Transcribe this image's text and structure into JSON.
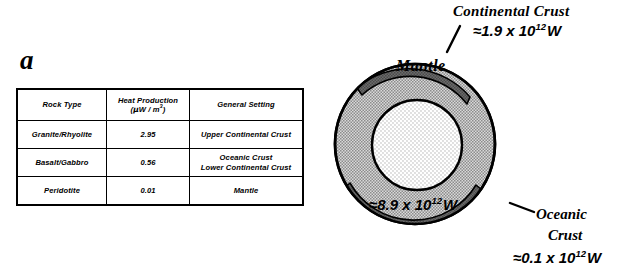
{
  "figure": {
    "panel_a_letter": "a",
    "panel_b_letter": "b"
  },
  "table": {
    "headers": [
      {
        "line1": "Rock Type",
        "line2": ""
      },
      {
        "line1": "Heat Production",
        "line2_prefix": "(",
        "line2_mu": "μ",
        "line2_mid": "W / m",
        "line2_sup": "3",
        "line2_suffix": ")"
      },
      {
        "line1": "General Setting",
        "line2": ""
      }
    ],
    "rows": [
      {
        "rock_type": "Granite/Rhyolite",
        "heat_production": "2.95",
        "general_setting_line1": "Upper Continental Crust",
        "general_setting_line2": ""
      },
      {
        "rock_type": "Basalt/Gabbro",
        "heat_production": "0.56",
        "general_setting_line1": "Oceanic Crust",
        "general_setting_line2": "Lower Continental Crust"
      },
      {
        "rock_type": "Peridotite",
        "heat_production": "0.01",
        "general_setting_line1": "Mantle",
        "general_setting_line2": ""
      }
    ]
  },
  "diagram": {
    "continental_crust": {
      "label": "Continental  Crust",
      "value_prefix": "≈1.9 x 10",
      "value_exponent": "12",
      "value_unit": "W"
    },
    "mantle": {
      "label": "Mantle",
      "value_prefix": "≈8.9 x 10",
      "value_exponent": "12",
      "value_unit": "W"
    },
    "oceanic_crust": {
      "label_line1": "Oceanic",
      "label_line2": "Crust",
      "value_prefix": "≈0.1 x 10",
      "value_exponent": "12",
      "value_unit": "W"
    },
    "colors": {
      "mantle_fill": "#b4b4b4",
      "core_fill": "#f2f2f2",
      "crust_fill": "#6e6e6e",
      "outline": "#000000"
    }
  }
}
